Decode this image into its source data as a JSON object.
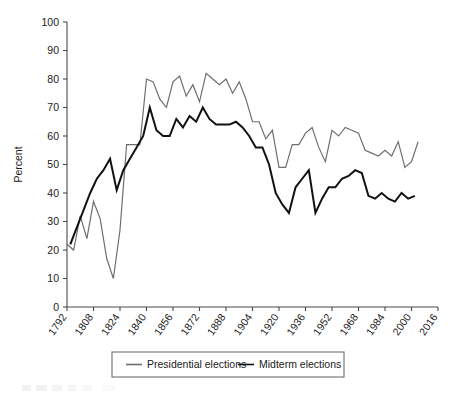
{
  "chart_data": {
    "type": "line",
    "title": "",
    "xlabel": "",
    "ylabel": "Percent",
    "xlim": [
      1792,
      2016
    ],
    "ylim": [
      0,
      100
    ],
    "grid": false,
    "legend_position": "bottom",
    "y_ticks": [
      0,
      10,
      20,
      30,
      40,
      50,
      60,
      70,
      80,
      90,
      100
    ],
    "x_ticks": [
      1792,
      1808,
      1824,
      1840,
      1856,
      1872,
      1888,
      1904,
      1920,
      1936,
      1952,
      1968,
      1984,
      2000,
      2016
    ],
    "series": [
      {
        "name": "Presidential elections",
        "color": "#6e6e6e",
        "width": 1.2,
        "x": [
          1792,
          1796,
          1800,
          1804,
          1808,
          1812,
          1816,
          1820,
          1824,
          1828,
          1832,
          1836,
          1840,
          1844,
          1848,
          1852,
          1856,
          1860,
          1864,
          1868,
          1872,
          1876,
          1880,
          1884,
          1888,
          1892,
          1896,
          1900,
          1904,
          1908,
          1912,
          1916,
          1920,
          1924,
          1928,
          1932,
          1936,
          1940,
          1944,
          1948,
          1952,
          1956,
          1960,
          1964,
          1968,
          1972,
          1976,
          1980,
          1984,
          1988,
          1992,
          1996,
          2000,
          2004
        ],
        "y": [
          22,
          20,
          32,
          24,
          37,
          31,
          17,
          10,
          27,
          57,
          57,
          57,
          80,
          79,
          73,
          70,
          79,
          81,
          74,
          78,
          72,
          82,
          80,
          78,
          80,
          75,
          79,
          73,
          65,
          65,
          59,
          62,
          49,
          49,
          57,
          57,
          61,
          63,
          56,
          51,
          62,
          60,
          63,
          62,
          61,
          55,
          54,
          53,
          55,
          53,
          58,
          49,
          51,
          58
        ]
      },
      {
        "name": "Midterm elections",
        "color": "#111111",
        "width": 2.0,
        "x": [
          1794,
          1798,
          1802,
          1806,
          1810,
          1814,
          1818,
          1822,
          1826,
          1830,
          1834,
          1838,
          1842,
          1846,
          1850,
          1854,
          1858,
          1862,
          1866,
          1870,
          1874,
          1878,
          1882,
          1886,
          1890,
          1894,
          1898,
          1902,
          1906,
          1910,
          1914,
          1918,
          1922,
          1926,
          1930,
          1934,
          1938,
          1942,
          1946,
          1950,
          1954,
          1958,
          1962,
          1966,
          1970,
          1974,
          1978,
          1982,
          1986,
          1990,
          1994,
          1998,
          2002
        ],
        "y": [
          22,
          28,
          34,
          40,
          45,
          48,
          52,
          41,
          48,
          52,
          56,
          60,
          70,
          62,
          60,
          60,
          66,
          63,
          67,
          65,
          70,
          66,
          64,
          64,
          64,
          65,
          63,
          60,
          56,
          56,
          50,
          40,
          36,
          33,
          42,
          45,
          48,
          33,
          38,
          42,
          42,
          45,
          46,
          48,
          47,
          39,
          38,
          40,
          38,
          37,
          40,
          38,
          39
        ]
      }
    ]
  },
  "legend": {
    "items": [
      {
        "label": "Presidential elections",
        "color": "#6e6e6e"
      },
      {
        "label": "Midterm elections",
        "color": "#111111"
      }
    ]
  }
}
